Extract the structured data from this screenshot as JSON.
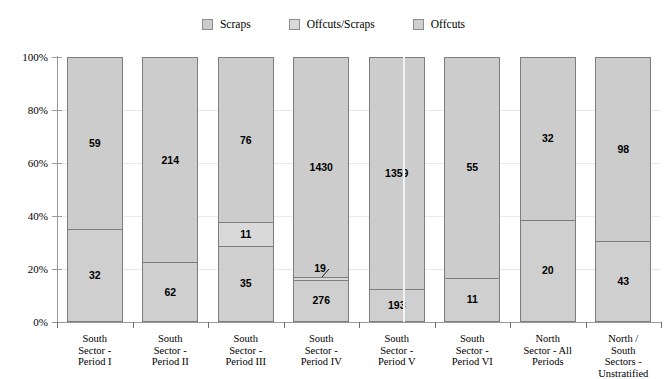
{
  "legend": {
    "position": "top-center",
    "entries": [
      {
        "label": "Scraps",
        "color": "#cccccc",
        "icon": "legend-swatch"
      },
      {
        "label": "Offcuts/Scraps",
        "color": "#d9d9d9",
        "icon": "legend-swatch"
      },
      {
        "label": "Offcuts",
        "color": "#cfcfcf",
        "icon": "legend-swatch"
      }
    ]
  },
  "axes": {
    "y_ticks": [
      "0%",
      "20%",
      "40%",
      "60%",
      "80%",
      "100%"
    ],
    "y_min": 0,
    "y_max": 100
  },
  "chart_data": {
    "type": "bar",
    "title": "",
    "xlabel": "",
    "ylabel": "",
    "ylim": [
      0,
      100
    ],
    "stacked": true,
    "percent_scale": true,
    "grid": false,
    "legend_position": "top-center",
    "categories": [
      "South Sector - Period I",
      "South Sector - Period II",
      "South Sector - Period III",
      "South Sector - Period IV",
      "South Sector - Period V",
      "South Sector - Period VI",
      "North Sector - All Periods",
      "North / South Sectors - Unstratified"
    ],
    "category_lines": [
      [
        "South",
        "Sector -",
        "Period I"
      ],
      [
        "South",
        "Sector -",
        "Period II"
      ],
      [
        "South",
        "Sector -",
        "Period III"
      ],
      [
        "South",
        "Sector -",
        "Period IV"
      ],
      [
        "South",
        "Sector -",
        "Period V"
      ],
      [
        "South",
        "Sector -",
        "Period VI"
      ],
      [
        "North",
        "Sector - All",
        "Periods"
      ],
      [
        "North /",
        "South",
        "Sectors -",
        "Unstratified"
      ]
    ],
    "series": [
      {
        "name": "Scraps",
        "color": "#cccccc",
        "values": [
          59,
          214,
          76,
          1430,
          1359,
          55,
          32,
          98
        ],
        "percents": [
          64.8,
          77.5,
          62.3,
          82.9,
          87.6,
          83.3,
          61.5,
          69.5
        ]
      },
      {
        "name": "Offcuts/Scraps",
        "color": "#d9d9d9",
        "values": [
          null,
          null,
          11,
          19,
          null,
          null,
          null,
          null
        ],
        "percents": [
          0,
          0,
          9.0,
          1.1,
          0,
          0,
          0,
          0
        ]
      },
      {
        "name": "Offcuts",
        "color": "#cfcfcf",
        "values": [
          32,
          62,
          35,
          276,
          193,
          11,
          20,
          43
        ],
        "percents": [
          35.2,
          22.5,
          28.7,
          16.0,
          12.4,
          16.7,
          38.5,
          30.5
        ]
      }
    ],
    "bar_labels": [
      [
        "59",
        "32"
      ],
      [
        "214",
        "62"
      ],
      [
        "76",
        "11",
        "35"
      ],
      [
        "1430",
        "19",
        "276"
      ],
      [
        "1359",
        "193"
      ],
      [
        "55",
        "11"
      ],
      [
        "32",
        "20"
      ],
      [
        "98",
        "43"
      ]
    ]
  }
}
